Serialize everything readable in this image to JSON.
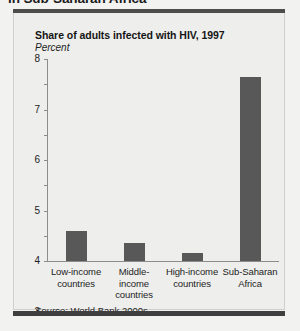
{
  "top_caption": "in Sub-Saharan Africa",
  "panel": {
    "title": "Share of adults infected with HIV, 1997",
    "subtitle": "Percent",
    "source_label": "Source:",
    "source_text": " World Bank 2000s."
  },
  "chart_data": {
    "type": "bar",
    "title": "Share of adults infected with HIV, 1997",
    "subtitle": "Percent",
    "xlabel": "",
    "ylabel": "Percent",
    "ylim": [
      0,
      8
    ],
    "yticks": [
      0,
      1,
      2,
      3,
      4,
      5,
      6,
      7,
      8
    ],
    "ytick_labels": [
      "0",
      "1",
      "2",
      "3",
      "4",
      "5",
      "6",
      "7",
      "8"
    ],
    "grid": false,
    "legend": "none",
    "bar_color": "#585858",
    "categories": [
      "Low-income countries",
      "Middle-income countries",
      "High-income countries",
      "Sub-Saharan Africa"
    ],
    "category_lines": [
      [
        "Low-income",
        "countries"
      ],
      [
        "Middle-income",
        "countries"
      ],
      [
        "High-income",
        "countries"
      ],
      [
        "Sub-Saharan",
        "Africa"
      ]
    ],
    "values": [
      1.2,
      0.7,
      0.3,
      7.3
    ],
    "source": "Source: World Bank 2000s."
  }
}
